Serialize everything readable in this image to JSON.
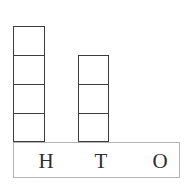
{
  "chart_data": {
    "type": "bar",
    "title": "",
    "subtitle": "",
    "xlabel": "",
    "ylabel": "",
    "categories": [
      "H",
      "T",
      "O"
    ],
    "category_names": [
      "Hundreds",
      "Tens",
      "Ones"
    ],
    "values": [
      4,
      3,
      0
    ],
    "unit": "block",
    "ylim": [
      0,
      4
    ],
    "grid": false,
    "legend": null,
    "annotations": []
  },
  "base_bar": {
    "labels": [
      {
        "id": "hundreds",
        "text": "H"
      },
      {
        "id": "tens",
        "text": "T"
      },
      {
        "id": "ones",
        "text": "O"
      }
    ]
  },
  "columns": [
    {
      "id": "hundreds",
      "label": "H",
      "blocks": 4
    },
    {
      "id": "tens",
      "label": "T",
      "blocks": 3
    },
    {
      "id": "ones",
      "label": "O",
      "blocks": 0
    }
  ],
  "colors": {
    "block_stroke": "#3c3c3c",
    "bar_stroke": "#b3b3b3",
    "text": "#2e2e2e",
    "background": "#ffffff"
  }
}
